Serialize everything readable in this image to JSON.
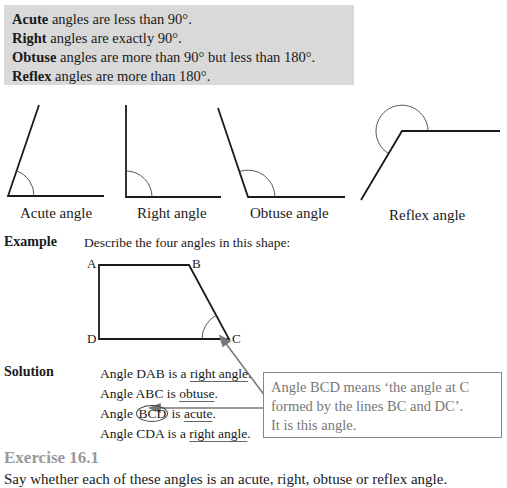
{
  "definitions": [
    {
      "term": "Acute",
      "rest": " angles are less than 90°."
    },
    {
      "term": "Right",
      "rest": " angles are exactly 90°."
    },
    {
      "term": "Obtuse",
      "rest": " angles are more than 90° but less than 180°."
    },
    {
      "term": "Reflex",
      "rest": " angles are more than 180°."
    }
  ],
  "figures": {
    "captions": [
      "Acute angle",
      "Right angle",
      "Obtuse angle",
      "Reflex angle"
    ]
  },
  "example": {
    "label": "Example",
    "prompt": "Describe the four angles in this shape:",
    "points": {
      "A": "A",
      "B": "B",
      "C": "C",
      "D": "D"
    }
  },
  "solution": {
    "label": "Solution",
    "rows": [
      {
        "pre": "Angle DAB is a ",
        "answer": "right angle",
        "post": "."
      },
      {
        "pre": "Angle ABC is ",
        "answer": "obtuse",
        "post": "."
      },
      {
        "pre": "Angle ",
        "circled": "BCD",
        "mid": " is ",
        "answer": "acute",
        "post": "."
      },
      {
        "pre": "Angle CDA is a ",
        "answer": "right angle",
        "post": "."
      }
    ]
  },
  "note": {
    "lines": [
      "Angle BCD means ‘the angle at C",
      "formed by the lines BC and DC’.",
      "It is this angle."
    ]
  },
  "exercise": {
    "heading": "Exercise 16.1",
    "instruction": "Say whether each of these angles is an acute, right, obtuse or reflex angle."
  },
  "colors": {
    "box_bg": "#d9d9d9",
    "annotation_gray": "#777777",
    "heading_gray": "#999999"
  }
}
